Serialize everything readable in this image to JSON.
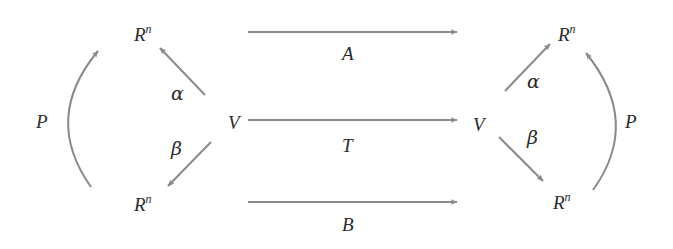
{
  "diagram": {
    "type": "commutative-diagram",
    "colors": {
      "arrow": "#8a8a8a",
      "text": "#2b2b2b",
      "background": "#ffffff"
    },
    "nodes": {
      "left_top": {
        "label": "R",
        "sup": "n"
      },
      "left_mid": {
        "label": "V"
      },
      "left_bottom": {
        "label": "R",
        "sup": "n"
      },
      "right_top": {
        "label": "R",
        "sup": "n"
      },
      "right_mid": {
        "label": "V"
      },
      "right_bottom": {
        "label": "R",
        "sup": "n"
      }
    },
    "arrows": {
      "top": {
        "label": "A"
      },
      "middle": {
        "label": "T"
      },
      "bottom": {
        "label": "B"
      },
      "left_alpha": {
        "label": "α"
      },
      "left_beta": {
        "label": "β"
      },
      "right_alpha": {
        "label": "α"
      },
      "right_beta": {
        "label": "β"
      },
      "left_p": {
        "label": "P"
      },
      "right_p": {
        "label": "P"
      }
    }
  }
}
